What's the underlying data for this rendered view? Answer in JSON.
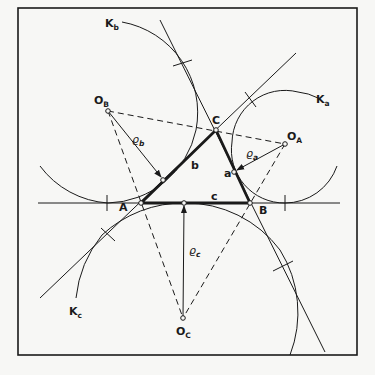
{
  "figure": {
    "colors": {
      "ink": "#1a1a1a",
      "paper": "#f7f7f5"
    },
    "vertices": [
      {
        "id": "A",
        "label": "A",
        "x": 141,
        "y": 203
      },
      {
        "id": "B",
        "label": "B",
        "x": 250,
        "y": 203
      },
      {
        "id": "C",
        "label": "C",
        "x": 216,
        "y": 130
      }
    ],
    "sides": [
      {
        "id": "a",
        "label": "a"
      },
      {
        "id": "b",
        "label": "b"
      },
      {
        "id": "c",
        "label": "c"
      }
    ],
    "excenters": [
      {
        "id": "OA",
        "label": "O",
        "sub": "A"
      },
      {
        "id": "OB",
        "label": "O",
        "sub": "B"
      },
      {
        "id": "OC",
        "label": "O",
        "sub": "C"
      }
    ],
    "radii": [
      {
        "id": "rho_a",
        "label": "ϱ",
        "sub": "a"
      },
      {
        "id": "rho_b",
        "label": "ϱ",
        "sub": "b"
      },
      {
        "id": "rho_c",
        "label": "ϱ",
        "sub": "c"
      }
    ],
    "circles": [
      {
        "id": "Ka",
        "label": "K",
        "sub": "a"
      },
      {
        "id": "Kb",
        "label": "K",
        "sub": "b"
      },
      {
        "id": "Kc",
        "label": "K",
        "sub": "c"
      }
    ]
  }
}
